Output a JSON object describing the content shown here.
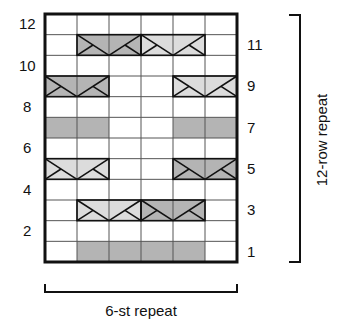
{
  "chart": {
    "stitch_repeat_label": "6-st repeat",
    "row_repeat_label": "12-row repeat",
    "columns": 6,
    "rows": 12,
    "left_row_numbers": [
      "12",
      "10",
      "8",
      "6",
      "4",
      "2"
    ],
    "right_row_numbers": [
      "11",
      "9",
      "7",
      "5",
      "3",
      "1"
    ],
    "colors": {
      "dark_shade": "#b4b4b4",
      "light_shade": "#dcdcdc",
      "grid_line": "#555555",
      "border": "#111111",
      "background": "#ffffff"
    }
  },
  "chart_data": {
    "type": "knitting-chart",
    "title": "",
    "columns": 6,
    "rows": 12,
    "x_label": "6-st repeat",
    "y_label": "12-row repeat",
    "row_labels_left_even": [
      12,
      10,
      8,
      6,
      4,
      2
    ],
    "row_labels_right_odd": [
      11,
      9,
      7,
      5,
      3,
      1
    ],
    "shaded_cells": [
      {
        "row": 1,
        "cols": [
          2,
          3,
          4,
          5
        ],
        "shade": "dark"
      },
      {
        "row": 7,
        "cols": [
          1,
          2
        ],
        "shade": "dark"
      },
      {
        "row": 7,
        "cols": [
          5,
          6
        ],
        "shade": "dark"
      }
    ],
    "cables": [
      {
        "row": 3,
        "cols": [
          2,
          3
        ],
        "shade": "light"
      },
      {
        "row": 3,
        "cols": [
          4,
          5
        ],
        "shade": "dark"
      },
      {
        "row": 5,
        "cols": [
          1,
          2
        ],
        "shade": "light"
      },
      {
        "row": 5,
        "cols": [
          5,
          6
        ],
        "shade": "dark"
      },
      {
        "row": 9,
        "cols": [
          1,
          2
        ],
        "shade": "dark"
      },
      {
        "row": 9,
        "cols": [
          5,
          6
        ],
        "shade": "light"
      },
      {
        "row": 11,
        "cols": [
          2,
          3
        ],
        "shade": "dark"
      },
      {
        "row": 11,
        "cols": [
          4,
          5
        ],
        "shade": "light"
      }
    ]
  }
}
